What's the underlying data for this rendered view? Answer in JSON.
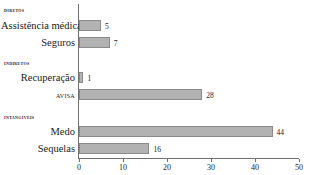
{
  "chart_data": {
    "type": "bar",
    "orientation": "horizontal",
    "title": "",
    "xlabel": "",
    "ylabel": "",
    "xlim": [
      0,
      50
    ],
    "xticks": [
      0,
      10,
      20,
      30,
      40,
      50
    ],
    "grid": false,
    "legend": false,
    "bar_color": "#b2b2b2",
    "bar_border_color": "#8a8a8a",
    "groups": [
      {
        "header": "DIRETOS",
        "categories": [
          "Assistência médica",
          "Seguros"
        ],
        "values": [
          5,
          7
        ]
      },
      {
        "header": "INDIRETOS",
        "categories": [
          "Recuperação",
          "AVISA"
        ],
        "values": [
          1,
          28
        ]
      },
      {
        "header": "INTANGÍVEIS",
        "categories": [
          "Medo",
          "Sequelas"
        ],
        "values": [
          44,
          16
        ]
      }
    ],
    "categories": [
      "Assistência médica",
      "Seguros",
      "Recuperação",
      "AVISA",
      "Medo",
      "Sequelas"
    ],
    "values": [
      5,
      7,
      1,
      28,
      44,
      16
    ]
  },
  "headers": {
    "diretos": "DIRETOS",
    "indiretos": "INDIRETOS",
    "intangiveis": "INTANGÍVEIS"
  },
  "bars": [
    {
      "label": "Assistência médica",
      "value": 5,
      "value_text": "5"
    },
    {
      "label": "Seguros",
      "value": 7,
      "value_text": "7"
    },
    {
      "label": "Recuperação",
      "value": 1,
      "value_text": "1"
    },
    {
      "label": "AVISA",
      "value": 28,
      "value_text": "28"
    },
    {
      "label": "Medo",
      "value": 44,
      "value_text": "44"
    },
    {
      "label": "Sequelas",
      "value": 16,
      "value_text": "16"
    }
  ],
  "axis": {
    "ticks": [
      {
        "value": 0,
        "label": "0"
      },
      {
        "value": 10,
        "label": "10"
      },
      {
        "value": 20,
        "label": "20"
      },
      {
        "value": 30,
        "label": "30"
      },
      {
        "value": 40,
        "label": "40"
      },
      {
        "value": 50,
        "label": "50"
      }
    ]
  }
}
